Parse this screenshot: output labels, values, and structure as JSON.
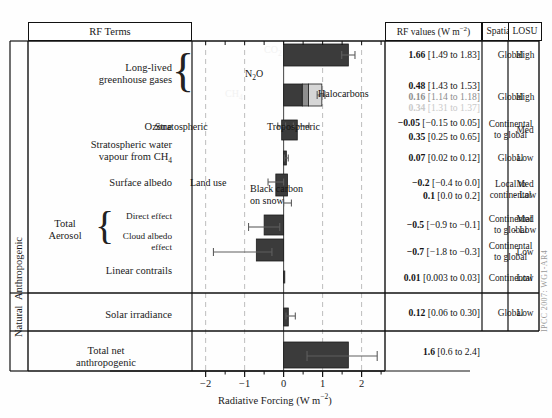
{
  "header": {
    "col_terms": "RF Terms",
    "col_values": "RF values (W m",
    "col_values_sup": "−2",
    "col_values_tail": ")",
    "col_spatial": "Spatial scale",
    "col_losu": "LOSU"
  },
  "side_labels": {
    "anthropogenic": "Anthropogenic",
    "natural": "Natural",
    "credit": "IPCC 2007: WG1-AR4"
  },
  "axis": {
    "label_main": "Radiative Forcing (W m",
    "label_sup": "−2",
    "label_tail": ")",
    "ticks": [
      "−2",
      "−1",
      "0",
      "1",
      "2"
    ],
    "tick_values": [
      -2,
      -1,
      0,
      1,
      2
    ],
    "minor_step": 0.25,
    "xmin": -2.35,
    "xmax": 2.6,
    "gridlines": [
      -2,
      -1,
      1,
      2
    ],
    "zeroline": 0
  },
  "terms": {
    "llghg": "Long-lived\ngreenhouse gases",
    "llghg_l1": "Long-lived",
    "llghg_l2": "greenhouse gases",
    "ozone": "Ozone",
    "stratwv_l1": "Stratospheric water",
    "stratwv_l2": "vapour from CH",
    "stratwv_sub": "4",
    "albedo": "Surface albedo",
    "total_aerosol_l1": "Total",
    "total_aerosol_l2": "Aerosol",
    "direct_effect": "Direct effect",
    "cloud_albedo_l1": "Cloud albedo",
    "cloud_albedo_l2": "effect",
    "contrails": "Linear contrails",
    "solar": "Solar irradiance",
    "totalnet_l1": "Total net",
    "totalnet_l2": "anthropogenic"
  },
  "annotations": {
    "co2": "CO",
    "co2_sub": "2",
    "n2o": "N",
    "n2o_sub": "2",
    "n2o_tail": "O",
    "ch4": "CH",
    "ch4_sub": "4",
    "halocarbons": "Halocarbons",
    "stratospheric": "Stratospheric",
    "tropospheric": "Tropospheric",
    "land_use": "Land use",
    "black_carbon_l1": "Black carbon",
    "black_carbon_l2": "on snow"
  },
  "colors": {
    "bar_dark": "#3b3b3b",
    "bar_mid": "#8e8e8e",
    "bar_light": "#d6d6d6",
    "grid": "#bdbdbd",
    "axis": "#111111",
    "error": "#5e5e5e"
  },
  "chart_data": {
    "type": "bar",
    "xlabel": "Radiative Forcing (W m−2)",
    "ylabel": "",
    "xlim": [
      -2.35,
      2.6
    ],
    "orientation": "horizontal",
    "grid": true,
    "legend": "none",
    "bars": [
      {
        "name": "CO2",
        "value": 1.66,
        "low": 1.49,
        "high": 1.83,
        "color": "#3b3b3b",
        "stack": null
      },
      {
        "name": "N2O",
        "value": 0.16,
        "low": 0.14,
        "high": 0.18,
        "color": "#8e8e8e",
        "stack": "ghg2"
      },
      {
        "name": "CH4",
        "value": 0.48,
        "low": 0.43,
        "high": 0.53,
        "color": "#3b3b3b",
        "stack": "ghg2"
      },
      {
        "name": "Halocarbons",
        "value": 0.34,
        "low": 0.31,
        "high": 0.37,
        "color": "#d6d6d6",
        "stack": "ghg2"
      },
      {
        "name": "Ozone stratospheric",
        "value": -0.05,
        "low": -0.15,
        "high": 0.05,
        "color": "#3b3b3b",
        "stack": "ozone"
      },
      {
        "name": "Ozone tropospheric",
        "value": 0.35,
        "low": 0.25,
        "high": 0.65,
        "color": "#3b3b3b",
        "stack": "ozone"
      },
      {
        "name": "Stratospheric water vapour from CH4",
        "value": 0.07,
        "low": 0.02,
        "high": 0.12,
        "color": "#3b3b3b",
        "stack": null
      },
      {
        "name": "Surface albedo land use",
        "value": -0.2,
        "low": -0.4,
        "high": 0.0,
        "color": "#3b3b3b",
        "stack": "albedo"
      },
      {
        "name": "Surface albedo black carbon",
        "value": 0.1,
        "low": 0.0,
        "high": 0.2,
        "color": "#3b3b3b",
        "stack": "albedo"
      },
      {
        "name": "Aerosol direct effect",
        "value": -0.5,
        "low": -0.9,
        "high": -0.1,
        "color": "#3b3b3b",
        "stack": null
      },
      {
        "name": "Aerosol cloud albedo effect",
        "value": -0.7,
        "low": -1.8,
        "high": -0.3,
        "color": "#3b3b3b",
        "stack": null
      },
      {
        "name": "Linear contrails",
        "value": 0.01,
        "low": 0.003,
        "high": 0.03,
        "color": "#3b3b3b",
        "stack": null
      },
      {
        "name": "Solar irradiance",
        "value": 0.12,
        "low": 0.06,
        "high": 0.3,
        "color": "#3b3b3b",
        "stack": null
      },
      {
        "name": "Total net anthropogenic",
        "value": 1.6,
        "low": 0.6,
        "high": 2.4,
        "color": "#3b3b3b",
        "stack": null
      }
    ],
    "xticks": [
      -2,
      -1,
      0,
      1,
      2
    ],
    "xticklabels": [
      "−2",
      "−1",
      "0",
      "1",
      "2"
    ]
  },
  "rows": [
    {
      "id": "ghg1",
      "values": [
        {
          "bold": "1.66",
          "rest": " [1.49 to 1.83]",
          "shade": "full"
        }
      ],
      "spatial": "Global",
      "losu": "High"
    },
    {
      "id": "ghg2",
      "values": [
        {
          "bold": "0.48",
          "rest": " [1.43 to 1.53]",
          "shade": "full"
        },
        {
          "bold": "0.16",
          "rest": " [1.14 to 1.18]",
          "shade": "faint"
        },
        {
          "bold": "0.34",
          "rest": " [1.31 to 1.37]",
          "shade": "faint2"
        }
      ],
      "spatial": "Global",
      "losu": "High"
    },
    {
      "id": "ozone",
      "values": [
        {
          "bold": "−0.05",
          "rest": " [−0.15 to 0.05]",
          "shade": "full"
        },
        {
          "bold": "0.35",
          "rest": " [0.25 to 0.65]",
          "shade": "full"
        }
      ],
      "spatial": "Continental\nto global",
      "spatial_l1": "Continental",
      "spatial_l2": "to global",
      "losu": "Med"
    },
    {
      "id": "stratwv",
      "values": [
        {
          "bold": "0.07",
          "rest": " [0.02 to 0.12]",
          "shade": "full"
        }
      ],
      "spatial": "Global",
      "losu": "Low"
    },
    {
      "id": "albedo",
      "values": [
        {
          "bold": "−0.2",
          "rest": " [−0.4 to 0.0]",
          "shade": "full"
        },
        {
          "bold": "0.1",
          "rest": " [0.0 to 0.2]",
          "shade": "full"
        }
      ],
      "spatial_l1": "Local to",
      "spatial_l2": "continental",
      "losu_l1": "Med",
      "losu_l2": "- Low"
    },
    {
      "id": "direct",
      "values": [
        {
          "bold": "−0.5",
          "rest": " [−0.9 to −0.1]",
          "shade": "full"
        }
      ],
      "spatial_l1": "Continental",
      "spatial_l2": "to global",
      "losu_l1": "Med",
      "losu_l2": "- Low"
    },
    {
      "id": "cloudalbedo",
      "values": [
        {
          "bold": "−0.7",
          "rest": " [−1.8 to −0.3]",
          "shade": "full"
        }
      ],
      "spatial_l1": "Continental",
      "spatial_l2": "to global",
      "losu": "Low"
    },
    {
      "id": "contrails",
      "values": [
        {
          "bold": "0.01",
          "rest": " [0.003 to 0.03]",
          "shade": "full"
        }
      ],
      "spatial": "Continental",
      "losu": "Low"
    },
    {
      "id": "solar",
      "values": [
        {
          "bold": "0.12",
          "rest": " [0.06 to 0.30]",
          "shade": "full"
        }
      ],
      "spatial": "Global",
      "losu": "Low"
    },
    {
      "id": "totalnet",
      "values": [
        {
          "bold": "1.6",
          "rest": " [0.6 to 2.4]",
          "shade": "full"
        }
      ],
      "spatial": "",
      "losu": ""
    }
  ]
}
